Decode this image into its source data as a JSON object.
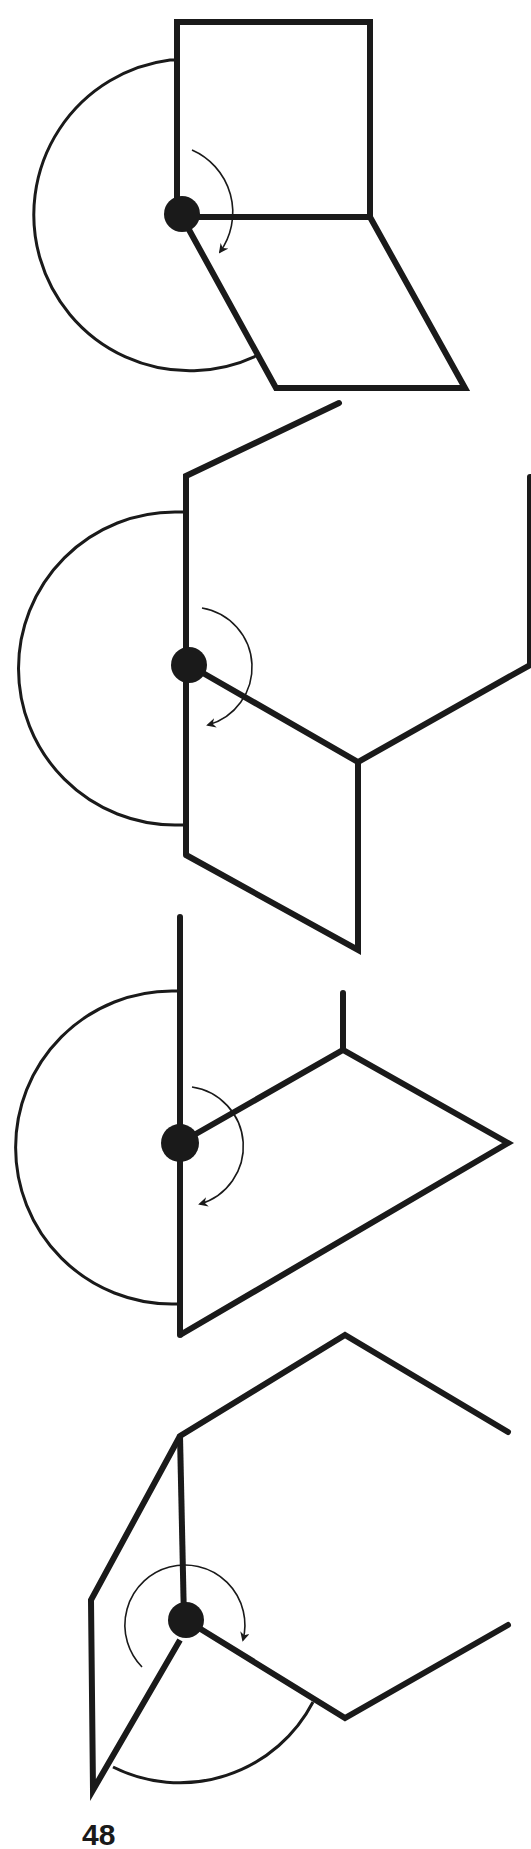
{
  "figures": [
    {
      "id": 1,
      "description": "square panel hinged to parallelogram, rotation about pivot"
    },
    {
      "id": 2,
      "description": "hinged panels with angled edges, rotation about pivot"
    },
    {
      "id": 3,
      "description": "vertical edge with kite-shaped panel, rotation about pivot"
    },
    {
      "id": 4,
      "description": "folded panels with pivot and circular rotation arrow"
    }
  ],
  "colors": {
    "stroke": "#1a1a1a",
    "background": "#ffffff"
  },
  "page_number": "48"
}
